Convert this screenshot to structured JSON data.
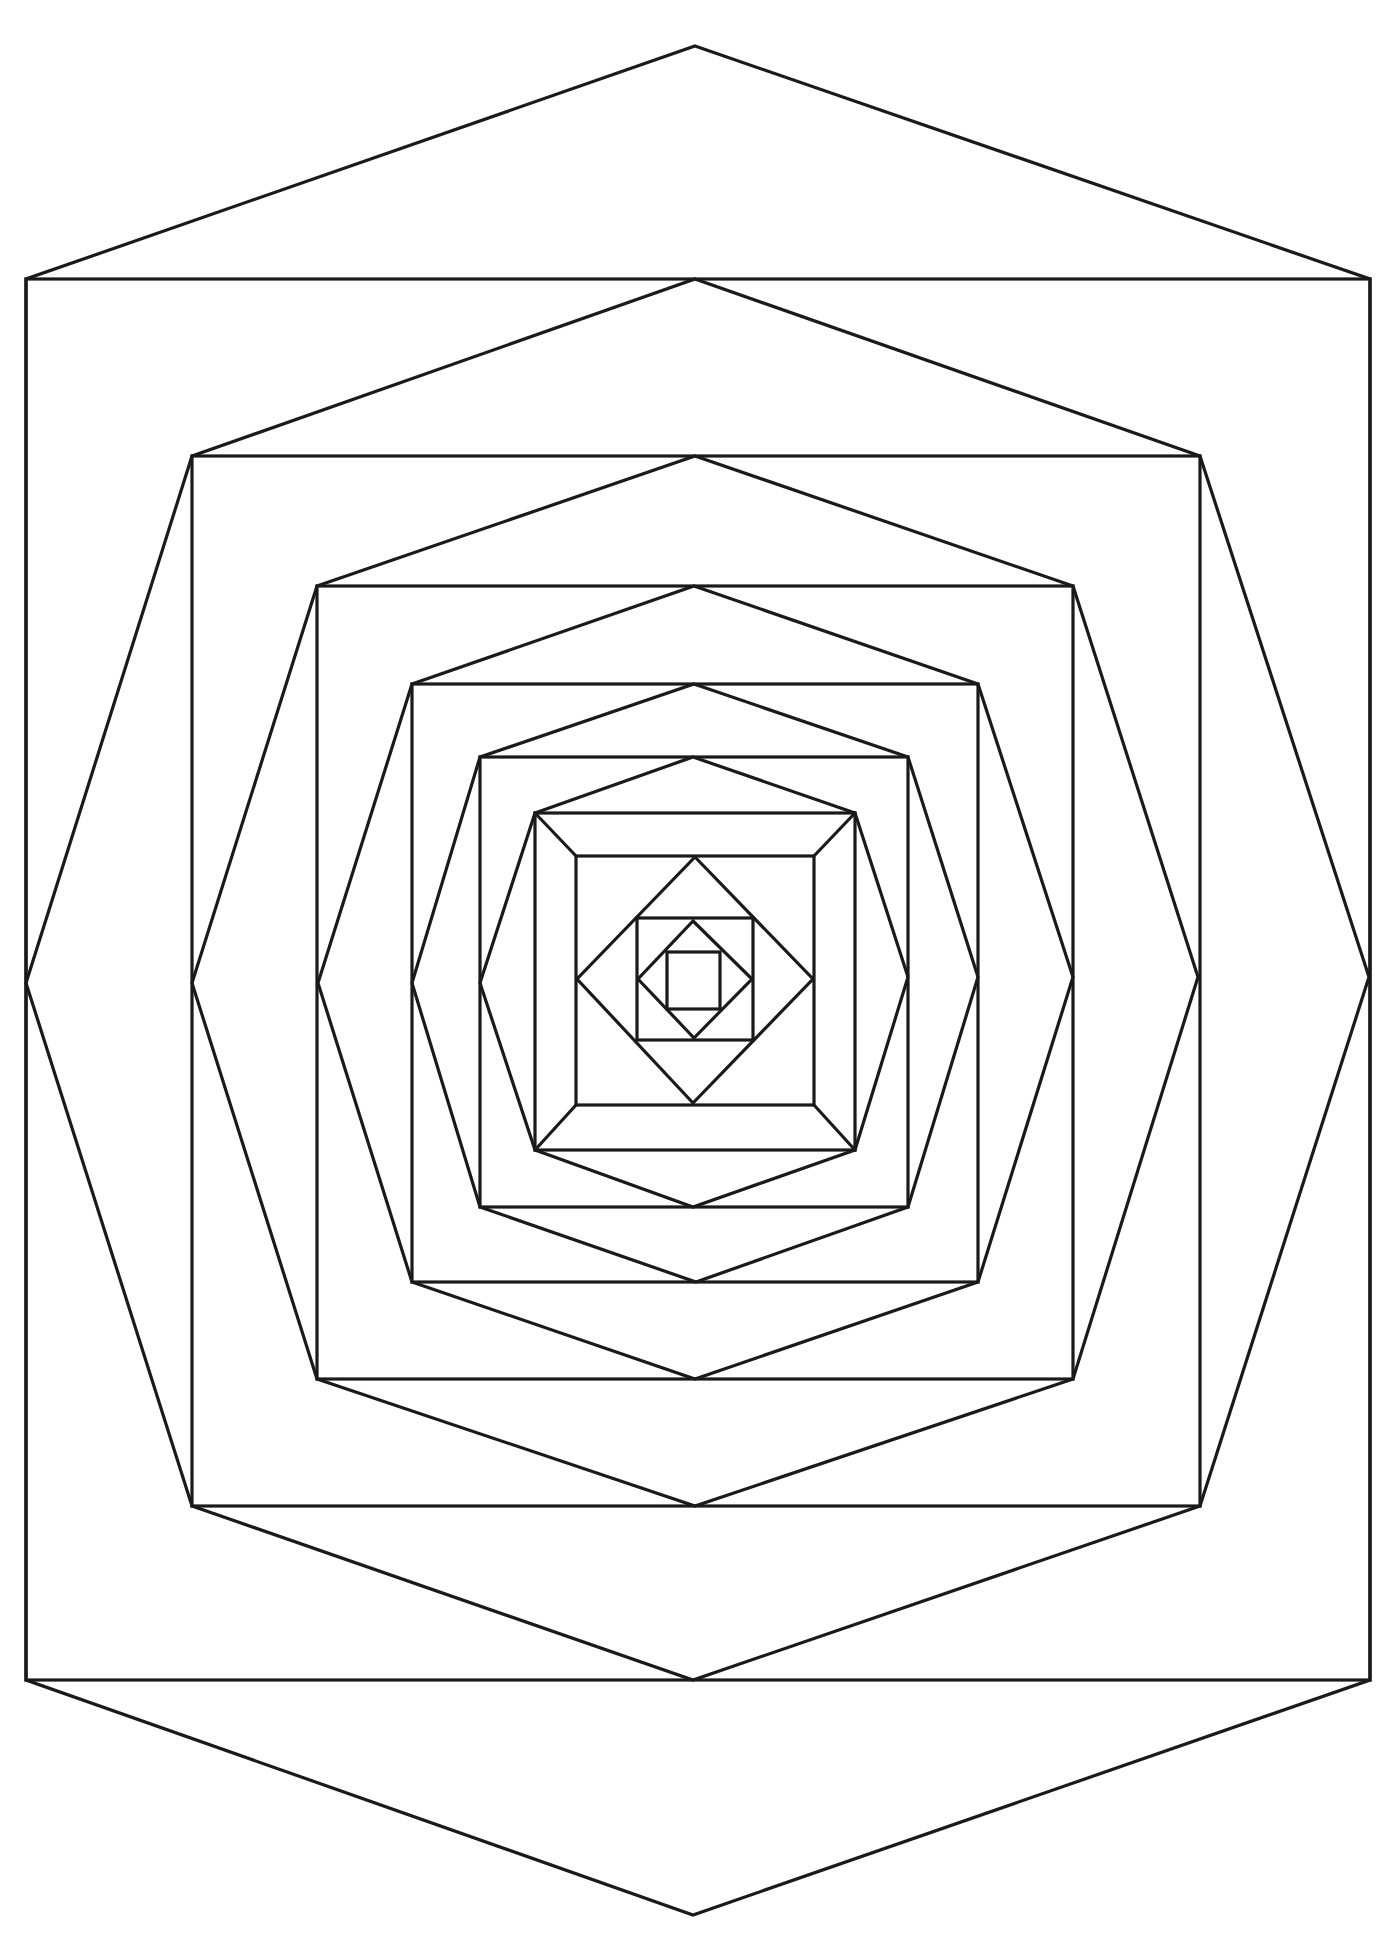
{
  "figure": {
    "title": "",
    "width": 1389,
    "height": 1943,
    "stroke_color": "#1a1a1a",
    "background_color": "#ffffff"
  },
  "rects": [
    {
      "name": "rect-1",
      "x1": 26,
      "y1": 279,
      "x2": 1370,
      "y2": 1680
    },
    {
      "name": "rect-2",
      "x1": 192,
      "y1": 456,
      "x2": 1200,
      "y2": 1506
    },
    {
      "name": "rect-3",
      "x1": 317,
      "y1": 586,
      "x2": 1073,
      "y2": 1379
    },
    {
      "name": "rect-4",
      "x1": 412,
      "y1": 684,
      "x2": 978,
      "y2": 1282
    },
    {
      "name": "rect-5",
      "x1": 480,
      "y1": 757,
      "x2": 908,
      "y2": 1207
    },
    {
      "name": "rect-6",
      "x1": 535,
      "y1": 813,
      "x2": 855,
      "y2": 1150
    },
    {
      "name": "rect-7",
      "x1": 576,
      "y1": 856,
      "x2": 814,
      "y2": 1105
    },
    {
      "name": "square-1",
      "x1": 637,
      "y1": 918,
      "x2": 753,
      "y2": 1040
    },
    {
      "name": "square-2",
      "x1": 667,
      "y1": 952,
      "x2": 720,
      "y2": 1009
    }
  ],
  "polygons": [
    {
      "name": "hexagon-1",
      "points": [
        [
          695,
          46
        ],
        [
          1370,
          279
        ],
        [
          1370,
          1680
        ],
        [
          693,
          1915
        ],
        [
          26,
          1680
        ],
        [
          26,
          279
        ]
      ]
    },
    {
      "name": "hexagon-2",
      "points": [
        [
          695,
          279
        ],
        [
          1200,
          456
        ],
        [
          1369,
          977
        ],
        [
          1200,
          1506
        ],
        [
          693,
          1680
        ],
        [
          192,
          1506
        ],
        [
          26,
          983
        ],
        [
          192,
          456
        ]
      ]
    },
    {
      "name": "hexagon-3",
      "points": [
        [
          695,
          456
        ],
        [
          1073,
          586
        ],
        [
          1198,
          977
        ],
        [
          1073,
          1379
        ],
        [
          695,
          1506
        ],
        [
          317,
          1379
        ],
        [
          192,
          983
        ],
        [
          317,
          586
        ]
      ]
    },
    {
      "name": "hexagon-4",
      "points": [
        [
          694,
          586
        ],
        [
          978,
          684
        ],
        [
          1073,
          977
        ],
        [
          978,
          1282
        ],
        [
          695,
          1379
        ],
        [
          412,
          1282
        ],
        [
          318,
          983
        ],
        [
          412,
          684
        ]
      ]
    },
    {
      "name": "hexagon-5",
      "points": [
        [
          694,
          684
        ],
        [
          908,
          757
        ],
        [
          978,
          977
        ],
        [
          908,
          1207
        ],
        [
          696,
          1282
        ],
        [
          480,
          1207
        ],
        [
          412,
          983
        ],
        [
          480,
          757
        ]
      ]
    },
    {
      "name": "hexagon-6",
      "points": [
        [
          693,
          757
        ],
        [
          855,
          813
        ],
        [
          908,
          977
        ],
        [
          855,
          1150
        ],
        [
          693,
          1207
        ],
        [
          535,
          1150
        ],
        [
          480,
          983
        ],
        [
          535,
          813
        ]
      ]
    },
    {
      "name": "diamond-1",
      "points": [
        [
          695,
          857
        ],
        [
          813,
          979
        ],
        [
          693,
          1103
        ],
        [
          577,
          979
        ]
      ]
    },
    {
      "name": "diamond-2",
      "points": [
        [
          693,
          921
        ],
        [
          752,
          979
        ],
        [
          694,
          1038
        ],
        [
          638,
          979
        ]
      ]
    }
  ],
  "lines": [
    {
      "name": "bevel-top-left",
      "x1": 535,
      "y1": 813,
      "x2": 576,
      "y2": 856
    },
    {
      "name": "bevel-top-right",
      "x1": 855,
      "y1": 813,
      "x2": 814,
      "y2": 856
    },
    {
      "name": "bevel-bottom-left",
      "x1": 535,
      "y1": 1150,
      "x2": 576,
      "y2": 1105
    },
    {
      "name": "bevel-bottom-right",
      "x1": 855,
      "y1": 1150,
      "x2": 814,
      "y2": 1105
    }
  ]
}
